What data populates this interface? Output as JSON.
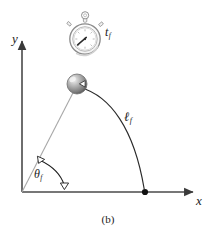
{
  "figure": {
    "caption": "(b)",
    "axes": {
      "y_label": "y",
      "x_label": "x",
      "origin": {
        "x": 22,
        "y": 192
      },
      "y_tip": {
        "x": 22,
        "y": 38
      },
      "x_tip": {
        "x": 196,
        "y": 192
      }
    },
    "labels": {
      "time_symbol": "t",
      "time_subscript": "f",
      "length_symbol": "ℓ",
      "length_subscript": "f",
      "angle_symbol": "θ",
      "angle_subscript": "f"
    },
    "objects": {
      "stopwatch": {
        "name": "stopwatch",
        "center": {
          "x": 85,
          "y": 38
        },
        "radius": 15,
        "hand_angle_deg": 215,
        "body_color": "#ffffff",
        "outline_color": "#8a8a8a"
      },
      "pendulum_bob": {
        "name": "sphere-bob",
        "center": {
          "x": 77,
          "y": 84
        },
        "radius": 10,
        "fill_color": "#9a9a9a",
        "highlight_color": "#e8e8e8",
        "shadow_color": "#5a5a5a"
      },
      "equilibrium_point": {
        "name": "equilibrium-dot",
        "x": 145,
        "y": 192,
        "radius": 3,
        "color": "#111111"
      }
    },
    "geometry": {
      "string_color": "#9a9a9a",
      "arc_color": "#1a1a1a",
      "axis_color": "#555555",
      "angle_arc_color": "#1a1a1a",
      "trajectory_start": {
        "x": 80,
        "y": 88
      },
      "trajectory_end": {
        "x": 145,
        "y": 189
      },
      "angle_arc_start": {
        "x": 41,
        "y": 160
      },
      "angle_arc_end": {
        "x": 64,
        "y": 186
      }
    },
    "colors": {
      "background": "#ffffff",
      "ink": "#1a1a1a",
      "gray": "#9a9a9a"
    }
  }
}
